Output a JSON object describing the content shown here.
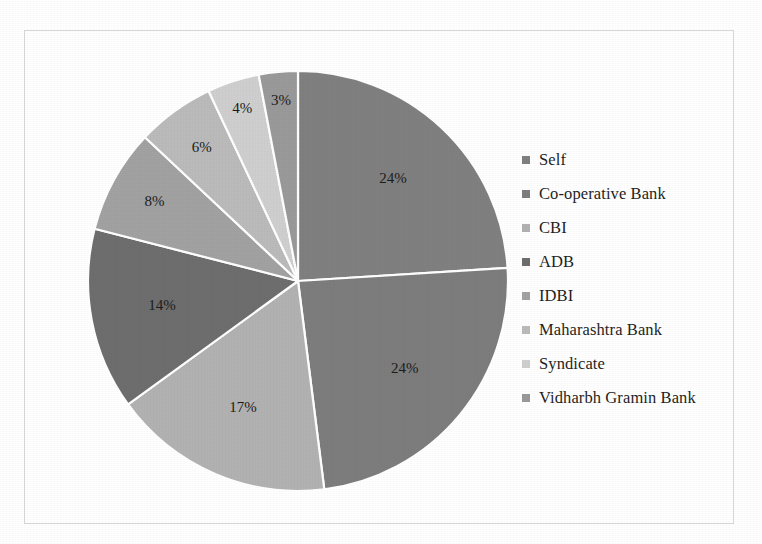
{
  "frame": {
    "border_color": "#d8d8d8",
    "background": "#ffffff"
  },
  "chart_data": {
    "type": "pie",
    "title": "",
    "subtitle": "",
    "xlabel": "",
    "ylabel": "",
    "legend_position": "right",
    "grid": false,
    "units": "percent",
    "start_angle_deg": 0,
    "direction": "clockwise",
    "categories": [
      "Self",
      "Co-operative Bank",
      "CBI",
      "ADB",
      "IDBI",
      "Maharashtra Bank",
      "Syndicate",
      "Vidharbh Gramin Bank"
    ],
    "values": [
      24,
      24,
      17,
      14,
      8,
      6,
      4,
      3
    ],
    "data_labels": [
      "24%",
      "24%",
      "17%",
      "14%",
      "8%",
      "6%",
      "4%",
      "3%"
    ],
    "colors": [
      "#808080",
      "#7d7d7d",
      "#b2b2b2",
      "#6e6e6e",
      "#a2a2a2",
      "#bbbbbb",
      "#cfcfcf",
      "#9a9a9a"
    ],
    "slice_border_color": "#ffffff"
  },
  "legend": {
    "items": [
      {
        "label": "Self",
        "color": "#808080"
      },
      {
        "label": "Co-operative Bank",
        "color": "#7d7d7d"
      },
      {
        "label": "CBI",
        "color": "#b2b2b2"
      },
      {
        "label": "ADB",
        "color": "#6e6e6e"
      },
      {
        "label": "IDBI",
        "color": "#a2a2a2"
      },
      {
        "label": "Maharashtra Bank",
        "color": "#bbbbbb"
      },
      {
        "label": "Syndicate",
        "color": "#cfcfcf"
      },
      {
        "label": "Vidharbh Gramin Bank",
        "color": "#9a9a9a"
      }
    ]
  }
}
